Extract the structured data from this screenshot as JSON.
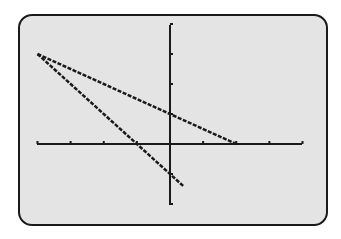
{
  "colors": {
    "screen_bg": "#e4e4e4",
    "border": "#1a1a1a",
    "ink": "#1a1a1a"
  },
  "chart_data": {
    "type": "line",
    "title": "",
    "xlabel": "",
    "ylabel": "",
    "xlim": [
      -4,
      4
    ],
    "ylim": [
      -2,
      4
    ],
    "xscl": 1,
    "yscl": 1,
    "grid": false,
    "legend": null,
    "series": [
      {
        "name": "y = -0.5x + 1",
        "x": [
          -4,
          2
        ],
        "y": [
          3,
          0
        ]
      },
      {
        "name": "y = -x - 1",
        "x": [
          -4,
          0.4
        ],
        "y": [
          3,
          -1.4
        ]
      }
    ]
  },
  "plot_px": {
    "x0": 37,
    "x1": 302,
    "y_top": 25,
    "y_bottom": 205,
    "origin_x": 170,
    "origin_y": 144
  }
}
